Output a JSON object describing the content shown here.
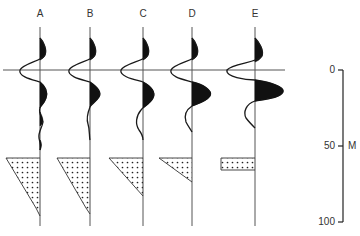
{
  "figure": {
    "type": "seismic wedge model / synthetic traces",
    "background": "#ffffff",
    "ink_color": "#1a1a1a"
  },
  "traces": [
    {
      "label": "A",
      "x": 40,
      "wedge": {
        "shape": "triangle",
        "top": 158,
        "bottom": 216,
        "left": 6,
        "bottom_x": 40
      },
      "tail": "long-ringing"
    },
    {
      "label": "B",
      "x": 90,
      "wedge": {
        "shape": "triangle",
        "top": 158,
        "bottom": 214,
        "left": 57,
        "bottom_x": 90
      },
      "tail": "ringing"
    },
    {
      "label": "C",
      "x": 143,
      "wedge": {
        "shape": "triangle",
        "top": 158,
        "bottom": 196,
        "left": 109,
        "bottom_x": 143
      },
      "tail": "single-sidelobe"
    },
    {
      "label": "D",
      "x": 192,
      "wedge": {
        "shape": "triangle",
        "top": 158,
        "bottom": 182,
        "left": 159,
        "bottom_x": 192
      },
      "tail": "single-sidelobe"
    },
    {
      "label": "E",
      "x": 255,
      "wedge": {
        "shape": "rectangle",
        "top": 158,
        "bottom": 170,
        "left": 221,
        "bottom_x": 255
      },
      "tail": "single-sidelobe"
    }
  ],
  "reference_line": {
    "y": 70,
    "x_start": 3,
    "x_end": 285
  },
  "scale_bar": {
    "unit": "M",
    "ticks": [
      {
        "label": "0",
        "value": 0
      },
      {
        "label": "50",
        "value": 50
      },
      {
        "label": "100",
        "value": 100
      }
    ]
  }
}
